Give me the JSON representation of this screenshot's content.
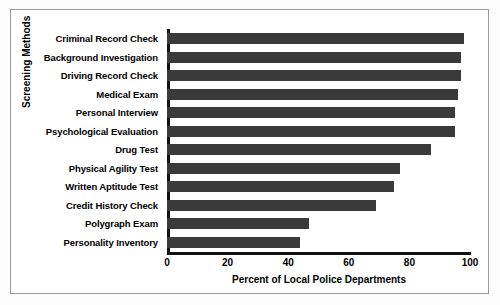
{
  "chart_data": {
    "type": "bar",
    "orientation": "horizontal",
    "title": "",
    "xlabel": "Percent of Local Police Departments",
    "ylabel": "Screening Methods",
    "xlim": [
      0,
      100
    ],
    "xticks": [
      "0",
      "20",
      "40",
      "60",
      "80",
      "100"
    ],
    "grid": false,
    "legend": null,
    "bar_color": "#3a3a3a",
    "categories": [
      "Criminal Record Check",
      "Background Investigation",
      "Driving Record Check",
      "Medical Exam",
      "Personal Interview",
      "Psychological Evaluation",
      "Drug Test",
      "Physical Agility Test",
      "Written Aptitude Test",
      "Credit History Check",
      "Polygraph Exam",
      "Personality Inventory"
    ],
    "values": [
      98,
      97,
      97,
      96,
      95,
      95,
      87,
      77,
      75,
      69,
      47,
      44
    ]
  }
}
